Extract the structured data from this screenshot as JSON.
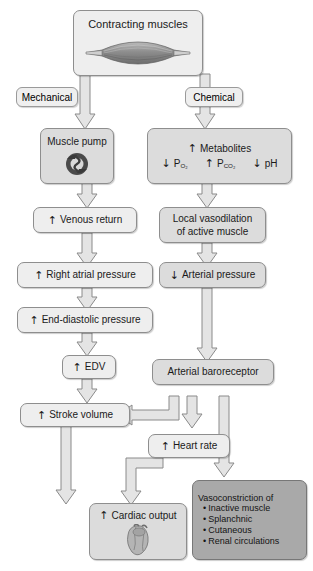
{
  "diagram": {
    "colors": {
      "node_light": "#eeeeee",
      "node_mid": "#dcdcdc",
      "node_dark": "#a9a9a9",
      "border": "#8e8e8e",
      "arrow_fill": "#e4e4e4",
      "arrow_stroke": "#8a8a8a",
      "text": "#1a1a1a",
      "background": "#ffffff"
    }
  },
  "nodes": {
    "contracting_muscles": {
      "label": "Contracting muscles",
      "icon": "skeletal-muscle-illustration"
    },
    "mechanical": {
      "label": "Mechanical"
    },
    "chemical": {
      "label": "Chemical"
    },
    "muscle_pump": {
      "label": "Muscle pump",
      "icon": "muscle-pump-illustration"
    },
    "metabolites": {
      "label": "Metabolites",
      "direction": "↑",
      "sub_items": [
        {
          "direction": "↓",
          "label": "P",
          "subscript": "O₂"
        },
        {
          "direction": "↑",
          "label": "P",
          "subscript": "CO₂"
        },
        {
          "direction": "↓",
          "label": "pH",
          "subscript": ""
        }
      ]
    },
    "venous_return": {
      "direction": "↑",
      "label": "Venous return"
    },
    "local_vasodilation": {
      "line1": "Local vasodilation",
      "line2": "of active muscle"
    },
    "right_atrial_pressure": {
      "direction": "↑",
      "label": "Right atrial pressure"
    },
    "arterial_pressure": {
      "direction": "↓",
      "label": "Arterial pressure"
    },
    "end_diastolic_pressure": {
      "direction": "↑",
      "label": "End-diastolic pressure"
    },
    "edv": {
      "direction": "↑",
      "label": "EDV"
    },
    "arterial_baroreceptor": {
      "label": "Arterial baroreceptor"
    },
    "stroke_volume": {
      "direction": "↑",
      "label": "Stroke volume"
    },
    "heart_rate": {
      "direction": "↑",
      "label": "Heart rate"
    },
    "cardiac_output": {
      "direction": "↑",
      "label": "Cardiac output",
      "icon": "heart-illustration"
    },
    "vasoconstriction": {
      "heading": "Vasoconstriction of",
      "items": [
        "Inactive muscle",
        "Splanchnic",
        "Cutaneous",
        "Renal circulations"
      ]
    }
  }
}
